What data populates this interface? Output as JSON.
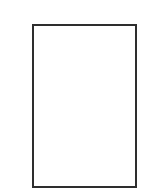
{
  "page": {
    "type": "blank-page-thumbnail",
    "content": "",
    "border_color": "#2e2e2e",
    "background_color": "#ffffff"
  }
}
